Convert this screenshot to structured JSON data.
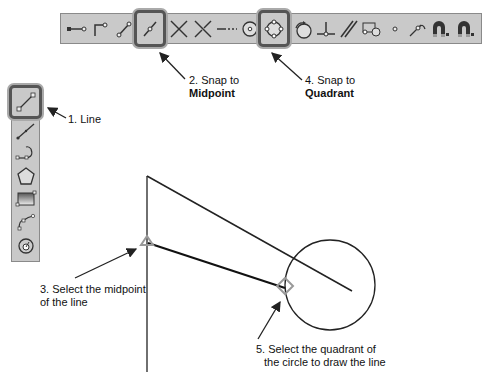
{
  "toolbar": {
    "snap_buttons": [
      {
        "name": "endpoint-snap",
        "icon": "endpoint-icon"
      },
      {
        "name": "corner-snap",
        "icon": "corner-icon"
      },
      {
        "name": "line-endpoint-snap",
        "icon": "line-endpoint-icon"
      },
      {
        "name": "midpoint-snap",
        "icon": "midpoint-icon",
        "selected": true
      },
      {
        "name": "intersection-snap",
        "icon": "intersection-icon"
      },
      {
        "name": "apparent-intersection-snap",
        "icon": "apparent-intersection-icon"
      },
      {
        "name": "extension-snap",
        "icon": "extension-icon"
      },
      {
        "name": "center-snap",
        "icon": "center-icon"
      },
      {
        "name": "quadrant-snap",
        "icon": "quadrant-icon",
        "selected": true
      },
      {
        "name": "tangent-snap",
        "icon": "tangent-icon"
      },
      {
        "name": "perpendicular-snap",
        "icon": "perpendicular-icon"
      },
      {
        "name": "parallel-snap",
        "icon": "parallel-icon"
      },
      {
        "name": "insert-snap",
        "icon": "insert-icon"
      },
      {
        "name": "node-snap",
        "icon": "node-icon"
      },
      {
        "name": "nearest-snap",
        "icon": "nearest-icon"
      },
      {
        "name": "snap-on-magnet",
        "icon": "magnet-icon"
      },
      {
        "name": "snap-off-magnet",
        "icon": "magnet-off-icon"
      }
    ]
  },
  "draw_toolbar": {
    "tools": [
      "line",
      "polyline",
      "arc",
      "polygon",
      "rectangle",
      "spline",
      "circle"
    ]
  },
  "callouts": {
    "step1": "1. Line",
    "step2_line1": "2. Snap to",
    "step2_line2": "Midpoint",
    "step3_line1": "3. Select the midpoint",
    "step3_line2": "of the line",
    "step4_line1": "4. Snap to",
    "step4_line2": "Quadrant",
    "step5_line1": "5. Select the quadrant of",
    "step5_line2": "the circle to draw the line"
  }
}
